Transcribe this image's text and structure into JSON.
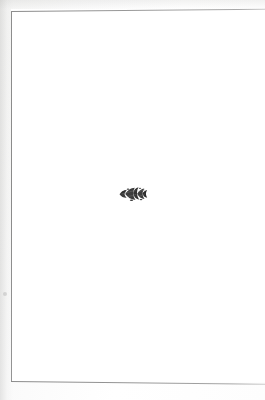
{
  "page": {
    "kind": "scanned-book-page",
    "body_text": "",
    "background_color": "#ffffff",
    "margin_color": "#f4f4f3"
  },
  "frame": {
    "name": "rule-border",
    "color": "#8d8d8d",
    "thickness_px": 1,
    "sides_visible": "top, left, bottom",
    "left_px": 11,
    "top_px": 11,
    "bottom_px": 381
  },
  "ornament": {
    "name": "fleuron",
    "label": "leaf fleuron ornament",
    "color": "#3a3a3a",
    "center_x_px": 133,
    "center_y_px": 194,
    "width_px": 26,
    "height_px": 16
  },
  "marks": {
    "margin_mark_label": "faint margin speck"
  }
}
